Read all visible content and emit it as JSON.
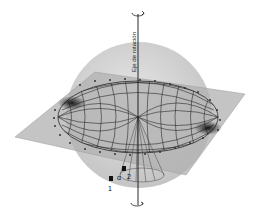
{
  "diagram": {
    "axis_label": "Eje de rotación",
    "labels": {
      "point1": "1",
      "point2": "2",
      "angle": "α"
    },
    "colors": {
      "background": "#ffffff",
      "sphere": "#cfcfcf",
      "plane": "#b5b5b5",
      "grid": "#2a2a2a",
      "axis": "#111111"
    },
    "elements": [
      "rotation-axis",
      "sphere",
      "plane",
      "elliptical-grid",
      "cone",
      "rotation-arrow-top",
      "rotation-arrow-bottom"
    ]
  }
}
